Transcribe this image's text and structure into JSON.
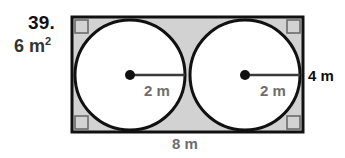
{
  "problem": {
    "number": "39.",
    "answer_value": "6 m",
    "answer_exponent": "2"
  },
  "figure": {
    "rectangle": {
      "x": 72,
      "y": 17,
      "width": 231,
      "height": 115,
      "fill_color": "#d2d2d2",
      "stroke_color": "#111111",
      "stroke_width": 3
    },
    "circles": [
      {
        "cx": 130,
        "cy": 75,
        "r": 55,
        "fill_color": "#ffffff",
        "stroke_color": "#111111",
        "stroke_width": 3
      },
      {
        "cx": 245,
        "cy": 75,
        "r": 55,
        "fill_color": "#ffffff",
        "stroke_color": "#111111",
        "stroke_width": 3
      }
    ],
    "center_dots": [
      {
        "cx": 130,
        "cy": 75,
        "r": 5
      },
      {
        "cx": 245,
        "cy": 75,
        "r": 5
      }
    ],
    "radius_lines": [
      {
        "x1": 130,
        "y1": 75,
        "x2": 185,
        "y2": 75
      },
      {
        "x1": 245,
        "y1": 75,
        "x2": 300,
        "y2": 75
      }
    ],
    "right_angle_marks": [
      {
        "x": 75,
        "y": 20,
        "size": 13
      },
      {
        "x": 287,
        "y": 20,
        "size": 13
      },
      {
        "x": 75,
        "y": 116,
        "size": 13
      },
      {
        "x": 287,
        "y": 116,
        "size": 13
      }
    ]
  },
  "labels": {
    "radius_left": "2 m",
    "radius_right": "2 m",
    "height_right": "4 m",
    "width_bottom": "8 m"
  },
  "colors": {
    "shaded_fill": "#d2d2d2",
    "circle_fill": "#ffffff",
    "outline": "#111111",
    "label_gray": "#6d6d6d",
    "label_black": "#0f0f0f",
    "problem_number": "#111111"
  }
}
